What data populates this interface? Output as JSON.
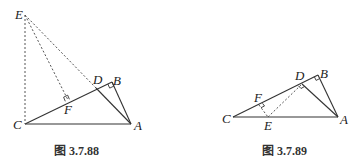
{
  "figures": [
    {
      "caption": "图 3.7.88",
      "points": {
        "E": {
          "label": "E",
          "x": 25,
          "y": 15
        },
        "D": {
          "label": "D",
          "x": 96,
          "y": 88
        },
        "B": {
          "label": "B",
          "x": 112,
          "y": 82
        },
        "F": {
          "label": "F",
          "x": 68,
          "y": 100
        },
        "C": {
          "label": "C",
          "x": 25,
          "y": 124
        },
        "A": {
          "label": "A",
          "x": 131,
          "y": 124
        }
      },
      "solid_segments": [
        "CA",
        "CB",
        "BA",
        "DA"
      ],
      "dashed_segments": [
        "EC",
        "EF",
        "ED"
      ],
      "right_angles": [
        "F",
        "B"
      ]
    },
    {
      "caption": "图 3.7.89",
      "points": {
        "C": {
          "label": "C",
          "x": 233,
          "y": 117
        },
        "A": {
          "label": "A",
          "x": 338,
          "y": 117
        },
        "B": {
          "label": "B",
          "x": 318,
          "y": 75
        },
        "D": {
          "label": "D",
          "x": 302,
          "y": 84
        },
        "F": {
          "label": "F",
          "x": 259,
          "y": 105
        },
        "E": {
          "label": "E",
          "x": 268,
          "y": 117
        }
      },
      "solid_segments": [
        "CA",
        "CB",
        "BA",
        "DA"
      ],
      "dashed_segments": [
        "FE",
        "ED"
      ],
      "right_angles": [
        "F",
        "D",
        "B"
      ]
    }
  ]
}
